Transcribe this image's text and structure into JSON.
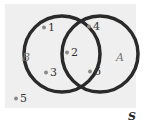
{
  "diagram": {
    "universe_label": "S",
    "sets": [
      {
        "label": "B",
        "cx": 62,
        "cy": 54,
        "r": 38
      },
      {
        "label": "A",
        "cx": 100,
        "cy": 54,
        "r": 38
      }
    ],
    "elements": [
      {
        "label": "1",
        "x": 44,
        "y": 31
      },
      {
        "label": "4",
        "x": 89,
        "y": 30
      },
      {
        "label": "2",
        "x": 67,
        "y": 56
      },
      {
        "label": "3",
        "x": 46,
        "y": 76
      },
      {
        "label": "6",
        "x": 90,
        "y": 75
      },
      {
        "label": "5",
        "x": 16,
        "y": 102
      }
    ],
    "colors": {
      "background": "#efefef",
      "circle": "#2a2a2a",
      "dot": "#8a8a8a",
      "text": "#333333",
      "set_label": "#777777"
    }
  }
}
